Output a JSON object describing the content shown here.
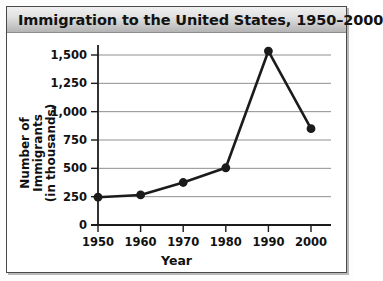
{
  "chart_data": {
    "type": "line",
    "title": "Immigration to the United States, 1950–2000",
    "xlabel": "Year",
    "ylabel": "Number of Immigrants",
    "ylabel_line2": "(in thousands)",
    "categories": [
      "1950",
      "1960",
      "1970",
      "1980",
      "1990",
      "2000"
    ],
    "x": [
      1950,
      1960,
      1970,
      1980,
      1990,
      2000
    ],
    "values": [
      245,
      265,
      375,
      505,
      1535,
      850
    ],
    "series": [
      {
        "name": "Number of Immigrants (in thousands)",
        "values": [
          245,
          265,
          375,
          505,
          1535,
          850
        ]
      }
    ],
    "ylim": [
      0,
      1500
    ],
    "ytick_values": [
      0,
      250,
      500,
      750,
      1000,
      1250,
      1500
    ],
    "ytick_labels": [
      "0",
      "250",
      "500",
      "750",
      "1,000",
      "1,250",
      "1,500"
    ],
    "xtick_labels": [
      "1950",
      "1960",
      "1970",
      "1980",
      "1990",
      "2000"
    ],
    "grid": "horizontal",
    "legend": "none",
    "line_color": "#1b1b1b",
    "marker": "circle",
    "marker_color": "#1b1b1b",
    "grid_color": "#8f8f8f",
    "axis_color": "#1b1b1b",
    "background_color": "#ffffff"
  },
  "figure": {
    "title_band_color": "#d6d6d6",
    "border_color": "#4a4a4a"
  }
}
